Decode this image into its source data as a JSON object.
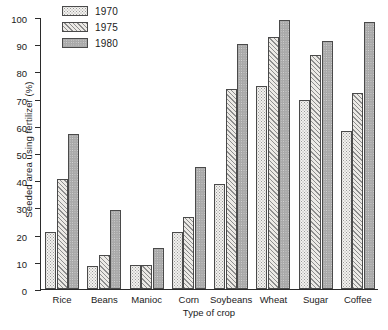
{
  "chart_data": {
    "type": "bar",
    "title": "",
    "xlabel": "Type of crop",
    "ylabel": "Seeded area using fertilizer (%)",
    "ylim": [
      0,
      100
    ],
    "ytick_step": 10,
    "yticks": [
      0,
      10,
      20,
      30,
      40,
      50,
      60,
      70,
      80,
      90,
      100
    ],
    "grid": false,
    "legend_position": "upper-left-inside",
    "categories": [
      "Rice",
      "Beans",
      "Manioc",
      "Corn",
      "Soybeans",
      "Wheat",
      "Sugar",
      "Coffee"
    ],
    "series": [
      {
        "name": "1970",
        "values": [
          21,
          8.5,
          9,
          21,
          38.5,
          74.5,
          69.5,
          58
        ]
      },
      {
        "name": "1975",
        "values": [
          40.5,
          12.5,
          9,
          26.5,
          73.5,
          92.5,
          86,
          72
        ]
      },
      {
        "name": "1980",
        "values": [
          57,
          29,
          15,
          45,
          90,
          99,
          91,
          98
        ]
      }
    ]
  },
  "axis": {
    "ylabel": "Seeded area using fertilizer (%)",
    "xlabel": "Type of crop",
    "ytick_labels": [
      "0",
      "10",
      "20",
      "30",
      "40",
      "50",
      "60",
      "70",
      "80",
      "90",
      "100"
    ],
    "xtick_labels": [
      "Rice",
      "Beans",
      "Manioc",
      "Corn",
      "Soybeans",
      "Wheat",
      "Sugar",
      "Coffee"
    ]
  },
  "legend": {
    "entries": [
      {
        "label": "1970",
        "pattern": "dotted-stipple-light"
      },
      {
        "label": "1975",
        "pattern": "diagonal-hatch"
      },
      {
        "label": "1980",
        "pattern": "solid-grey"
      }
    ]
  },
  "caption": ""
}
